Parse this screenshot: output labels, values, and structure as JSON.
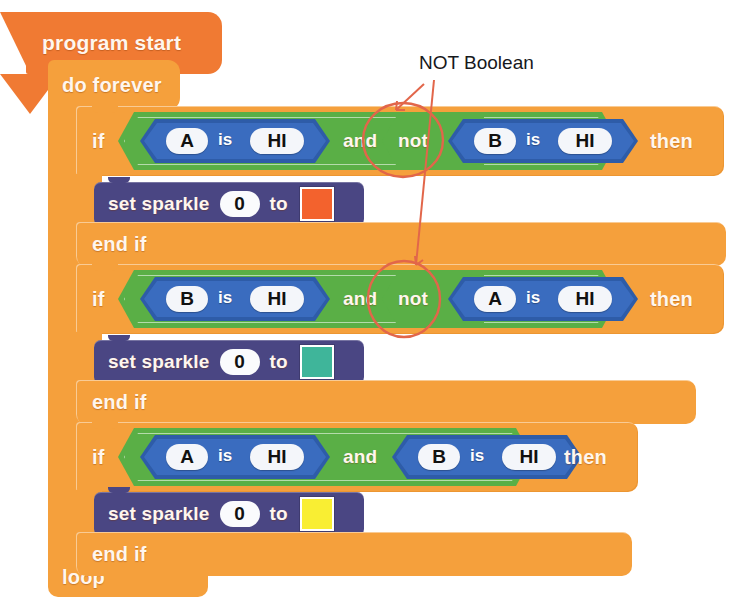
{
  "annotation": {
    "label": "NOT Boolean",
    "color": "#E2664A"
  },
  "palette": {
    "hat_orange": "#F07A33",
    "loop_orange": "#F5A03C",
    "and_green": "#5AAF46",
    "compare_blue": "#2E5CA8",
    "set_purple": "#4A4683",
    "page_background": "#FFFFFF"
  },
  "program": {
    "start_label": "program start",
    "forever_label": "do forever",
    "loop_label": "loop",
    "end_if_label": "end if",
    "if_label": "if",
    "then_label": "then",
    "and_label": "and",
    "not_label": "not",
    "is_label": "is",
    "set_label": "set sparkle",
    "to_label": "to",
    "blocks": [
      {
        "if_label": "if",
        "then_label": "then",
        "condition": {
          "operator": "and",
          "left": {
            "type": "compare",
            "pin": "A",
            "is": "is",
            "level": "HI",
            "negated": false
          },
          "right": {
            "type": "compare",
            "pin": "B",
            "is": "is",
            "level": "HI",
            "negated": true,
            "not_label": "not"
          }
        },
        "body": {
          "set_label": "set sparkle",
          "index": "0",
          "to_label": "to",
          "color": "#F3622D",
          "color_name": "orange-red"
        },
        "end_if_label": "end if"
      },
      {
        "if_label": "if",
        "then_label": "then",
        "condition": {
          "operator": "and",
          "left": {
            "type": "compare",
            "pin": "B",
            "is": "is",
            "level": "HI",
            "negated": false
          },
          "right": {
            "type": "compare",
            "pin": "A",
            "is": "is",
            "level": "HI",
            "negated": true,
            "not_label": "not"
          }
        },
        "body": {
          "set_label": "set sparkle",
          "index": "0",
          "to_label": "to",
          "color": "#3FB59A",
          "color_name": "teal"
        },
        "end_if_label": "end if"
      },
      {
        "if_label": "if",
        "then_label": "then",
        "condition": {
          "operator": "and",
          "left": {
            "type": "compare",
            "pin": "A",
            "is": "is",
            "level": "HI",
            "negated": false
          },
          "right": {
            "type": "compare",
            "pin": "B",
            "is": "is",
            "level": "HI",
            "negated": false
          }
        },
        "body": {
          "set_label": "set sparkle",
          "index": "0",
          "to_label": "to",
          "color": "#F9EE33",
          "color_name": "yellow"
        },
        "end_if_label": "end if"
      }
    ]
  }
}
